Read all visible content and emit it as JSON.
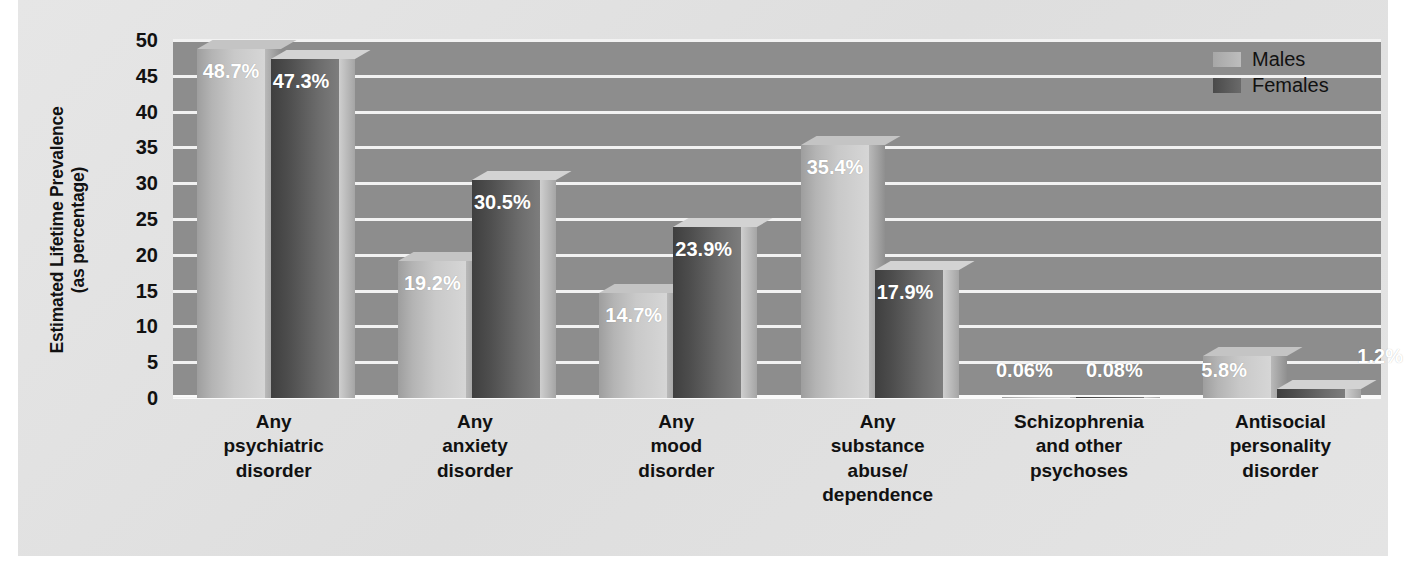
{
  "chart_data": {
    "type": "bar",
    "title": "",
    "xlabel": "",
    "ylabel": "Estimated Lifetime Prevalence (as percentage)",
    "ylabel_line1": "Estimated Lifetime Prevalence",
    "ylabel_line2": "(as percentage)",
    "ylim": [
      0,
      50
    ],
    "yticks": [
      50,
      45,
      40,
      35,
      30,
      25,
      20,
      15,
      10,
      5,
      0
    ],
    "ytick_labels": [
      "50",
      "45",
      "40",
      "35",
      "30",
      "25",
      "20",
      "15",
      "10",
      "5",
      "0"
    ],
    "grid": true,
    "legend_position": "top-right",
    "categories": [
      "Any\npsychiatric\ndisorder",
      "Any\nanxiety\ndisorder",
      "Any\nmood\ndisorder",
      "Any\nsubstance\nabuse/\ndependence",
      "Schizophrenia\nand other\npsychoses",
      "Antisocial\npersonality\ndisorder"
    ],
    "category_lines": [
      [
        "Any",
        "psychiatric",
        "disorder"
      ],
      [
        "Any",
        "anxiety",
        "disorder"
      ],
      [
        "Any",
        "mood",
        "disorder"
      ],
      [
        "Any",
        "substance",
        "abuse/",
        "dependence"
      ],
      [
        "Schizophrenia",
        "and other",
        "psychoses"
      ],
      [
        "Antisocial",
        "personality",
        "disorder"
      ]
    ],
    "series": [
      {
        "name": "Males",
        "color": "#bdbdbd",
        "values": [
          48.7,
          19.2,
          14.7,
          35.4,
          0.06,
          5.8
        ],
        "labels": [
          "48.7%",
          "19.2%",
          "14.7%",
          "35.4%",
          "0.06%",
          "5.8%"
        ]
      },
      {
        "name": "Females",
        "color": "#5a5a5a",
        "values": [
          47.3,
          30.5,
          23.9,
          17.9,
          0.08,
          1.2
        ],
        "labels": [
          "47.3%",
          "30.5%",
          "23.9%",
          "17.9%",
          "0.08%",
          "1.2%"
        ]
      }
    ]
  },
  "legend": {
    "items": [
      {
        "label": "Males",
        "key": "males"
      },
      {
        "label": "Females",
        "key": "females"
      }
    ]
  },
  "colors": {
    "panel_background": "#e2e2e2",
    "plot_background": "#8d8d8d",
    "gridline": "#f2f2f2",
    "males_bar": "#bdbdbd",
    "females_bar": "#5a5a5a",
    "value_label": "#ffffff",
    "axis_text": "#111111"
  }
}
